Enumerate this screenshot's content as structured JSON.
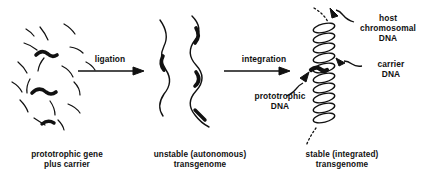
{
  "figure": {
    "ink_color": "#111111",
    "background_color": "#ffffff"
  },
  "stages": [
    {
      "id": "stage-fragments",
      "caption_line1": "prototrophic gene",
      "caption_line2": "plus carrier",
      "graphic": "scattered-dna-fragments"
    },
    {
      "id": "stage-transgenome",
      "caption_line1": "unstable (autonomous)",
      "caption_line2": "transgenome",
      "graphic": "wavy-dna-strands"
    },
    {
      "id": "stage-integrated",
      "caption_line1": "stable (integrated)",
      "caption_line2": "transgenome",
      "graphic": "coiled-chromosome-helix"
    }
  ],
  "arrows": [
    {
      "id": "arrow-ligation",
      "label": "ligation"
    },
    {
      "id": "arrow-integration",
      "label": "integration"
    }
  ],
  "callouts": [
    {
      "id": "callout-host-dna",
      "line1": "host",
      "line2": "chromosomal",
      "line3": "DNA"
    },
    {
      "id": "callout-carrier-dna",
      "line1": "carrier",
      "line2": "DNA"
    },
    {
      "id": "callout-prototrophic-dna",
      "line1": "prototrophic",
      "line2": "DNA"
    }
  ]
}
